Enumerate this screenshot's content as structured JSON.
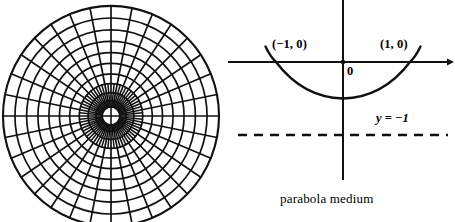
{
  "figure": {
    "title": "parabola medium",
    "background_color": "#ffffff",
    "ink_color": "#111111",
    "width": 455,
    "height": 222
  },
  "panels": {
    "left": {
      "name": "polar-grid",
      "description": "circular polar coordinate grid",
      "center": {
        "x": 111,
        "y": 116
      },
      "outer_radius": 108,
      "inner_hole_radius": 9,
      "ring_count": 10,
      "spoke_count": 32,
      "inner_spoke_count": 64,
      "has_center_cross": true
    },
    "right": {
      "name": "parabola-plot",
      "x_axis_y": 62,
      "y_axis_x": 343,
      "x_axis_start": 228,
      "x_axis_end": 452,
      "y_axis_top": 0,
      "y_axis_bottom": 180,
      "arrow_at_x_axis_end": true
    }
  },
  "chart_data": {
    "type": "line",
    "title": "parabola medium",
    "curve": "parabola",
    "equation": "y = x^2 - 1",
    "xlabel": "",
    "ylabel": "",
    "roots": [
      -1,
      1
    ],
    "vertex": {
      "x": 0,
      "y": -1
    },
    "x": [
      -1.15,
      -1.0,
      -0.75,
      -0.5,
      -0.25,
      0,
      0.25,
      0.5,
      0.75,
      1.0,
      1.15
    ],
    "y": [
      0.3225,
      0,
      -0.4375,
      -0.75,
      -0.9375,
      -1,
      -0.9375,
      -0.75,
      -0.4375,
      0,
      0.3225
    ],
    "xlim": [
      -1.7,
      1.7
    ],
    "ylim": [
      -2.6,
      1.0
    ],
    "grid": false,
    "legend": "none",
    "annotations": [
      {
        "name": "left-root",
        "text": "(−1, 0)",
        "x": -1,
        "y": 0
      },
      {
        "name": "right-root",
        "text": "(1, 0)",
        "x": 1,
        "y": 0
      },
      {
        "name": "origin",
        "text": "0",
        "x": 0,
        "y": 0
      },
      {
        "name": "asymptote",
        "text": "y = −1",
        "x": 0.85,
        "y": -1
      }
    ],
    "reference_line": {
      "name": "directrix",
      "style": "dashed",
      "label": "y = −1",
      "y": -1
    }
  },
  "labels": {
    "left_root": "(−1, 0)",
    "right_root": "(1, 0)",
    "origin": "0",
    "asymptote": "y = −1",
    "caption": "parabola medium"
  }
}
